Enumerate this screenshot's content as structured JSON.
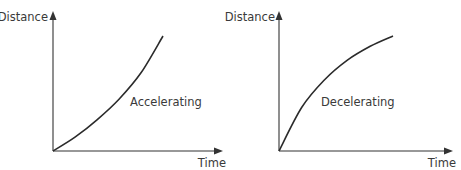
{
  "chart_data": [
    {
      "type": "line",
      "title": "",
      "xlabel": "Time",
      "ylabel": "Distance",
      "annotation": "Accelerating",
      "curve_shape": "convex",
      "description": "Distance increases at an increasing rate over time",
      "x": [
        0,
        0.2,
        0.4,
        0.6,
        0.8,
        1.0
      ],
      "y": [
        0,
        0.12,
        0.27,
        0.45,
        0.68,
        1.0
      ],
      "ylim": [
        0,
        1.2
      ],
      "xlim": [
        0,
        1.5
      ],
      "grid": false,
      "legend": "none"
    },
    {
      "type": "line",
      "title": "",
      "xlabel": "Time",
      "ylabel": "Distance",
      "annotation": "Decelerating",
      "curve_shape": "concave",
      "description": "Distance increases at a decreasing rate over time",
      "x": [
        0,
        0.2,
        0.4,
        0.6,
        0.8,
        1.0
      ],
      "y": [
        0,
        0.38,
        0.62,
        0.79,
        0.91,
        1.0
      ],
      "ylim": [
        0,
        1.2
      ],
      "xlim": [
        0,
        1.5
      ],
      "grid": false,
      "legend": "none"
    }
  ]
}
